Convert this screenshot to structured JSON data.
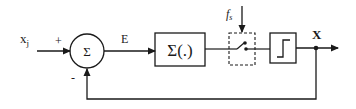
{
  "diagram": {
    "type": "block-diagram",
    "colors": {
      "stroke": "#1a1a1a",
      "background": "#ffffff"
    },
    "input": {
      "label": "x",
      "subscript": "j",
      "sign": "+"
    },
    "summing_junction": {
      "symbol": "Σ",
      "feedback_sign": "-"
    },
    "error_signal": {
      "label": "E"
    },
    "accumulator": {
      "label": "Σ(.)"
    },
    "sampler": {
      "clock_label": "f",
      "clock_subscript": "s",
      "style": "dashed box with switch"
    },
    "quantizer": {
      "symbol": "step-function"
    },
    "output": {
      "label": "X"
    },
    "feedback": {
      "from": "output node",
      "to": "summing junction (bottom)"
    }
  }
}
